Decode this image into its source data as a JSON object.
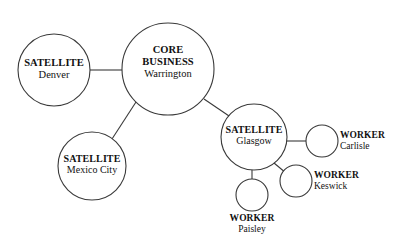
{
  "diagram": {
    "stroke_color": "#3a3a3a",
    "fill_color": "#ffffff",
    "text_color": "#111111",
    "background": "#ffffff",
    "nodes": [
      {
        "id": "denver",
        "type_label": "SATELLITE",
        "name_label": "Denver",
        "cx": 54,
        "cy": 70,
        "r": 36,
        "label_position": "inside"
      },
      {
        "id": "warrington",
        "type_label_line1": "CORE",
        "type_label_line2": "BUSINESS",
        "name_label": "Warrington",
        "cx": 168,
        "cy": 69,
        "r": 46,
        "label_position": "inside"
      },
      {
        "id": "mexico-city",
        "type_label": "SATELLITE",
        "name_label": "Mexico City",
        "cx": 92,
        "cy": 166,
        "r": 34,
        "label_position": "inside"
      },
      {
        "id": "glasgow",
        "type_label": "SATELLITE",
        "name_label": "Glasgow",
        "cx": 254,
        "cy": 137,
        "r": 33,
        "label_position": "inside"
      },
      {
        "id": "carlisle",
        "type_label": "WORKER",
        "name_label": "Carlisle",
        "cx": 322,
        "cy": 141,
        "r": 16,
        "label_position": "right"
      },
      {
        "id": "keswick",
        "type_label": "WORKER",
        "name_label": "Keswick",
        "cx": 296,
        "cy": 181,
        "r": 16,
        "label_position": "right"
      },
      {
        "id": "paisley",
        "type_label": "WORKER",
        "name_label": "Paisley",
        "cx": 252,
        "cy": 195,
        "r": 16,
        "label_position": "below"
      }
    ],
    "edges": [
      {
        "id": "denver-warrington",
        "from": "denver",
        "to": "warrington",
        "x1": 90,
        "y1": 70,
        "x2": 122,
        "y2": 70
      },
      {
        "id": "warrington-mexico-city",
        "from": "warrington",
        "to": "mexico-city",
        "x1": 136,
        "y1": 102,
        "x2": 112,
        "y2": 139
      },
      {
        "id": "warrington-glasgow",
        "from": "warrington",
        "to": "glasgow",
        "x1": 204,
        "y1": 99,
        "x2": 232,
        "y2": 118
      },
      {
        "id": "glasgow-carlisle",
        "from": "glasgow",
        "to": "carlisle",
        "x1": 286,
        "y1": 141,
        "x2": 306,
        "y2": 141
      },
      {
        "id": "glasgow-keswick",
        "from": "glasgow",
        "to": "keswick",
        "x1": 274,
        "y1": 163,
        "x2": 286,
        "y2": 173
      },
      {
        "id": "glasgow-paisley",
        "from": "glasgow",
        "to": "paisley",
        "x1": 252,
        "y1": 170,
        "x2": 252,
        "y2": 179
      }
    ]
  }
}
